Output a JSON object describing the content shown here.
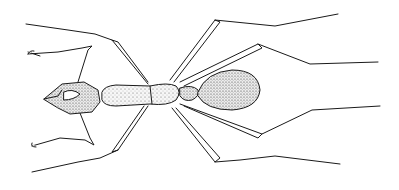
{
  "image": {
    "subject": "Ant illustration (dorsal view)",
    "style": "black ink stipple drawing on white",
    "colors": {
      "background": "#ffffff",
      "ink": "#1a1a1a",
      "fill": "#f2f2f2"
    }
  }
}
